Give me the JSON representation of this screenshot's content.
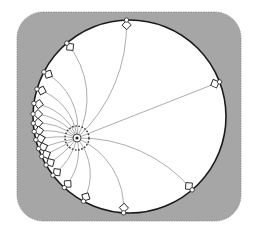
{
  "diagram": {
    "title": "Poincaré disk geodesics from a focal point",
    "colors": {
      "background": "#ffffff",
      "frame_fill": "#a6a6a6",
      "frame_border": "#8c8c8c",
      "disk_fill": "#ffffff",
      "disk_stroke": "#1a1a1a",
      "geodesic_stroke": "#8a8a8a",
      "marker_stroke": "#222222",
      "marker_fill": "#ffffff",
      "focus_fill": "#222222",
      "dashed_ring": "#333333"
    },
    "frame": {
      "x": 17,
      "y": 12,
      "width": 224,
      "height": 209,
      "corner_radius": 26
    },
    "disk": {
      "cx": 129.5,
      "cy": 116.5,
      "r": 96.5
    },
    "focus": {
      "x": 77,
      "y": 138,
      "inner_ring_r": 4,
      "dashed_ring_r": 12,
      "dot_r": 1.6
    },
    "ideal_points": [
      {
        "angle_deg": -91.8,
        "label": "top"
      },
      {
        "angle_deg": -130.5
      },
      {
        "angle_deg": -152.5
      },
      {
        "angle_deg": -163.5
      },
      {
        "angle_deg": -172.2
      },
      {
        "angle_deg": -178.5
      },
      {
        "angle_deg": 176.0
      },
      {
        "angle_deg": 171.0
      },
      {
        "angle_deg": 166.0
      },
      {
        "angle_deg": 160.5
      },
      {
        "angle_deg": 155.5
      },
      {
        "angle_deg": 149.8
      },
      {
        "angle_deg": 142.5
      },
      {
        "angle_deg": 132.5
      },
      {
        "angle_deg": 118.5
      },
      {
        "angle_deg": 93.5
      },
      {
        "angle_deg": 49.5,
        "label": "lower-right"
      },
      {
        "angle_deg": -21.0,
        "label": "right-diameter"
      }
    ],
    "marker": {
      "circle_r": 2.2,
      "square_size": 6.5,
      "square_inset": 5
    }
  }
}
